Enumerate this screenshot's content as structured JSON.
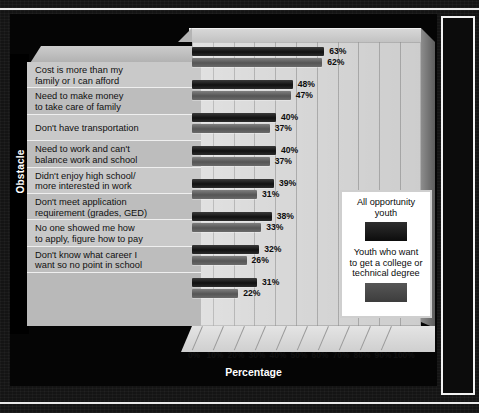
{
  "chart_data": {
    "type": "bar",
    "orientation": "horizontal",
    "title": "",
    "xlabel": "Percentage",
    "ylabel": "Obstacle",
    "xlim": [
      0,
      100
    ],
    "xtick_labels": [
      "0%",
      "10%",
      "20%",
      "30%",
      "40%",
      "50%",
      "60%",
      "70%",
      "80%",
      "90%",
      "100%"
    ],
    "xtick_values": [
      0,
      10,
      20,
      30,
      40,
      50,
      60,
      70,
      80,
      90,
      100
    ],
    "grid": true,
    "legend_position": "inside-right",
    "categories": [
      "Cost is more than my family or I can afford",
      "Need to make money to take care of family",
      "Don't have transportation",
      "Need to work and can't balance work and school",
      "Didn't enjoy high school/ more interested in work",
      "Don't meet application requirement (grades, GED)",
      "No one showed me how to apply, figure how to pay",
      "Don't know what career I want so no point in school"
    ],
    "series": [
      {
        "name": "All opportunity youth",
        "color": "#151515",
        "values": [
          63,
          48,
          40,
          40,
          39,
          38,
          32,
          31
        ],
        "value_labels": [
          "63%",
          "48%",
          "40%",
          "40%",
          "39%",
          "38%",
          "32%",
          "31%"
        ]
      },
      {
        "name": "Youth who want to get a college or technical degree",
        "color": "#5a5a5a",
        "values": [
          62,
          47,
          37,
          37,
          31,
          33,
          26,
          22
        ],
        "value_labels": [
          "62%",
          "47%",
          "37%",
          "37%",
          "31%",
          "33%",
          "26%",
          "22%"
        ]
      }
    ]
  },
  "category_labels": [
    {
      "line1": "Cost is more than my",
      "line2": "family or I can afford"
    },
    {
      "line1": "Need to make money",
      "line2": "to take care of family"
    },
    {
      "line1": "Don't have transportation",
      "line2": ""
    },
    {
      "line1": "Need to work and can't",
      "line2": "balance work and school"
    },
    {
      "line1": "Didn't enjoy high school/",
      "line2": "more interested in work"
    },
    {
      "line1": "Don't meet application",
      "line2": "requirement (grades, GED)"
    },
    {
      "line1": "No one showed me how",
      "line2": "to apply, figure how to pay"
    },
    {
      "line1": "Don't know what career I",
      "line2": "want so no point in school"
    }
  ],
  "legend": {
    "entry1_label_line1": "All opportunity",
    "entry1_label_line2": "youth",
    "entry2_label_line1": "Youth who want",
    "entry2_label_line2": "to get a college or",
    "entry2_label_line3": "technical degree"
  },
  "axis_titles": {
    "x": "Percentage",
    "y": "Obstacle"
  },
  "colors": {
    "series_dark": "#151515",
    "series_light": "#5a5a5a",
    "panel": "#d8d8d8",
    "label_strip": "#c9c9c9",
    "stage": "#050505",
    "frame_rule": "#e9e9e9"
  }
}
